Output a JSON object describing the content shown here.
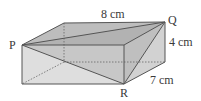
{
  "diagram": {
    "type": "cuboid",
    "labels": {
      "length": "8 cm",
      "height": "4 cm",
      "width": "7 cm",
      "vertex_p": "P",
      "vertex_q": "Q",
      "vertex_r": "R"
    },
    "colors": {
      "edge": "#555555",
      "top_face": "#b8b8b8",
      "front_face": "#dcdcdc",
      "side_face": "#cfcfcf",
      "triangle": "#a8a8a8"
    }
  }
}
